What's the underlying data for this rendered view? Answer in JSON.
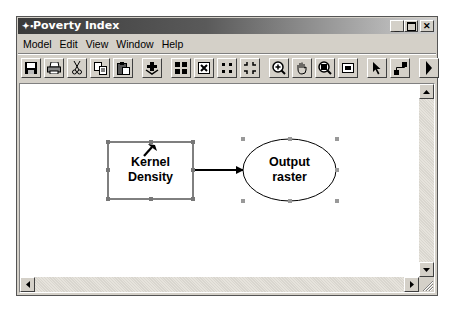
{
  "window": {
    "title": "Poverty Index",
    "title_icon": "model-icon",
    "controls": [
      {
        "name": "minimize-button",
        "glyph": "_"
      },
      {
        "name": "maximize-button",
        "glyph": "□"
      },
      {
        "name": "close-button",
        "glyph": "×"
      }
    ]
  },
  "menubar": {
    "items": [
      "Model",
      "Edit",
      "View",
      "Window",
      "Help"
    ]
  },
  "toolbar": {
    "buttons": [
      "save-icon",
      "print-icon",
      "cut-icon",
      "copy-icon",
      "paste-icon",
      "add-data-icon",
      "auto-layout-icon",
      "full-extent-icon",
      "zoom-in-fixed-icon",
      "zoom-out-fixed-icon",
      "zoom-in-icon",
      "pan-icon",
      "zoom-icon",
      "overview-icon",
      "select-icon",
      "connect-icon",
      "run-icon"
    ]
  },
  "diagram": {
    "nodes": [
      {
        "id": "kernel-density",
        "shape": "rectangle",
        "label_line1": "Kernel",
        "label_line2": "Density",
        "selected": true,
        "icon": "hammer-icon"
      },
      {
        "id": "output-raster",
        "shape": "ellipse",
        "label_line1": "Output",
        "label_line2": "raster",
        "selected": true
      }
    ],
    "connectors": [
      {
        "from": "kernel-density",
        "to": "output-raster"
      }
    ]
  },
  "colors": {
    "titlebar_dark": "#3a3a3a",
    "window_face": "#d4d0c8",
    "canvas": "#ffffff",
    "handle": "#777777"
  }
}
